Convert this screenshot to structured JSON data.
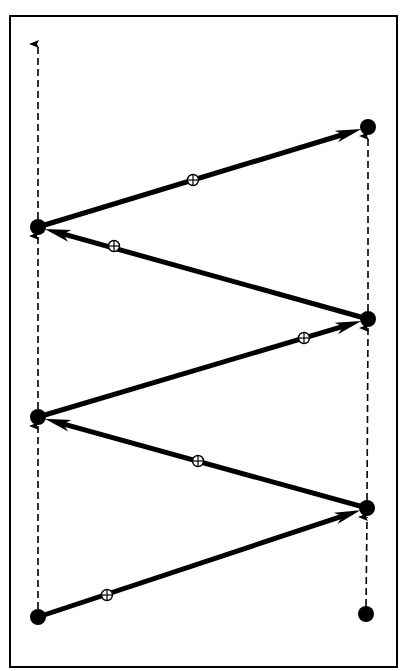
{
  "diagram": {
    "type": "zig-zag message sequence between two vertical timelines",
    "colors": {
      "background": "#ffffff",
      "ink": "#000000"
    },
    "frame": {
      "x": 10,
      "y": 16,
      "width": 387,
      "height": 651
    },
    "timelines": [
      {
        "id": "left",
        "x": 38,
        "y_start": 617,
        "y_end": 44,
        "style": "dashed",
        "direction": "up"
      },
      {
        "id": "right",
        "x": 367,
        "y_start": 614,
        "y_end": 127,
        "style": "dashed",
        "direction": "up"
      }
    ],
    "nodes": [
      {
        "id": "L1",
        "x": 38,
        "y": 617
      },
      {
        "id": "L2",
        "x": 38,
        "y": 417
      },
      {
        "id": "L3",
        "x": 38,
        "y": 227
      },
      {
        "id": "R0",
        "x": 366,
        "y": 614
      },
      {
        "id": "R1",
        "x": 367,
        "y": 508
      },
      {
        "id": "R2",
        "x": 368,
        "y": 319
      },
      {
        "id": "R3",
        "x": 368,
        "y": 127
      }
    ],
    "dashed_segments": [
      {
        "from": "L1",
        "to": "L2"
      },
      {
        "from": "L2",
        "to": "L3"
      },
      {
        "from": "L3",
        "to_y": 44
      },
      {
        "from": "R0",
        "to": "R1"
      },
      {
        "from": "R1",
        "to": "R2"
      },
      {
        "from": "R2",
        "to": "R3"
      }
    ],
    "arrows": [
      {
        "from": "L1",
        "to": "R1",
        "marker": {
          "x": 107,
          "y": 595,
          "icon": "circle-cross"
        }
      },
      {
        "from": "R1",
        "to": "L2",
        "marker": {
          "x": 198,
          "y": 461,
          "icon": "circle-cross"
        }
      },
      {
        "from": "L2",
        "to": "R2",
        "marker": {
          "x": 304,
          "y": 338,
          "icon": "circle-cross"
        }
      },
      {
        "from": "R2",
        "to": "L3",
        "marker": {
          "x": 114,
          "y": 246,
          "icon": "circle-cross"
        }
      },
      {
        "from": "L3",
        "to": "R3",
        "marker": {
          "x": 193,
          "y": 180,
          "icon": "circle-cross"
        }
      }
    ]
  }
}
